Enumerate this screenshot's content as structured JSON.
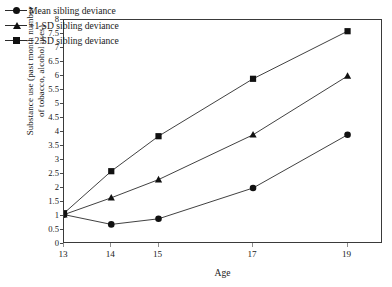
{
  "chart_data": {
    "type": "line",
    "title": "",
    "xlabel": "Age",
    "ylabel_line1": "Substance use (past month number",
    "ylabel_line2": "of tobacco, alcohol uses)",
    "x": [
      13,
      14,
      15,
      17,
      19
    ],
    "xtick_labels": [
      "13",
      "14",
      "15",
      "17",
      "19"
    ],
    "xlim": [
      13,
      19.75
    ],
    "ylim": [
      0,
      8
    ],
    "ytick_labels": [
      "8",
      "7.5",
      "7",
      "6.5",
      "6",
      "5.5",
      "5",
      "4.5",
      "4",
      "3.5",
      "3",
      "2.5",
      "2",
      "1.5",
      "1",
      "0.5",
      "0"
    ],
    "ytick_values": [
      8,
      7.5,
      7,
      6.5,
      6,
      5.5,
      5,
      4.5,
      4,
      3.5,
      3,
      2.5,
      2,
      1.5,
      1,
      0.5,
      0
    ],
    "grid": false,
    "legend_position": "top-left",
    "line_color": "#2b2b2b",
    "series": [
      {
        "name": "Mean sibling deviance",
        "marker": "circle",
        "values": [
          1.05,
          0.7,
          0.9,
          2.0,
          3.9
        ]
      },
      {
        "name": "+1 SD sibling deviance",
        "marker": "triangle",
        "values": [
          1.05,
          1.65,
          2.3,
          3.9,
          6.0
        ]
      },
      {
        "name": "+2 SD sibling deviance",
        "marker": "square",
        "values": [
          1.1,
          2.6,
          3.85,
          5.9,
          7.6
        ]
      }
    ]
  },
  "legend": {
    "items": [
      {
        "label": "Mean sibling deviance",
        "marker": "circle-marker"
      },
      {
        "label": "+1 SD sibling deviance",
        "marker": "triangle-marker"
      },
      {
        "label": "+2 SD sibling deviance",
        "marker": "square-marker"
      }
    ]
  },
  "axes": {
    "x_title": "Age",
    "y_title_line1": "Substance use (past month number",
    "y_title_line2": "of tobacco, alcohol uses)"
  }
}
